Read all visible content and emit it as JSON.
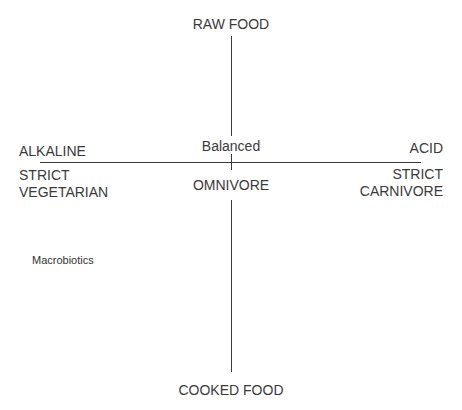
{
  "diagram": {
    "type": "quadrant-axes",
    "vertical_axis": {
      "top_label": "RAW FOOD",
      "bottom_label": "COOKED FOOD"
    },
    "horizontal_axis": {
      "left_label": "ALKALINE",
      "right_label": "ACID"
    },
    "center": {
      "above": "Balanced",
      "below": "OMNIVORE"
    },
    "left_below_axis": {
      "line1": "STRICT",
      "line2": "VEGETARIAN"
    },
    "right_below_axis": {
      "line1": "STRICT",
      "line2": "CARNIVORE"
    },
    "annotations": [
      {
        "text": "Macrobiotics",
        "quadrant": "lower-left"
      }
    ],
    "colors": {
      "background": "#ffffff",
      "lines": "#3a3a3a",
      "text": "#333333"
    }
  }
}
